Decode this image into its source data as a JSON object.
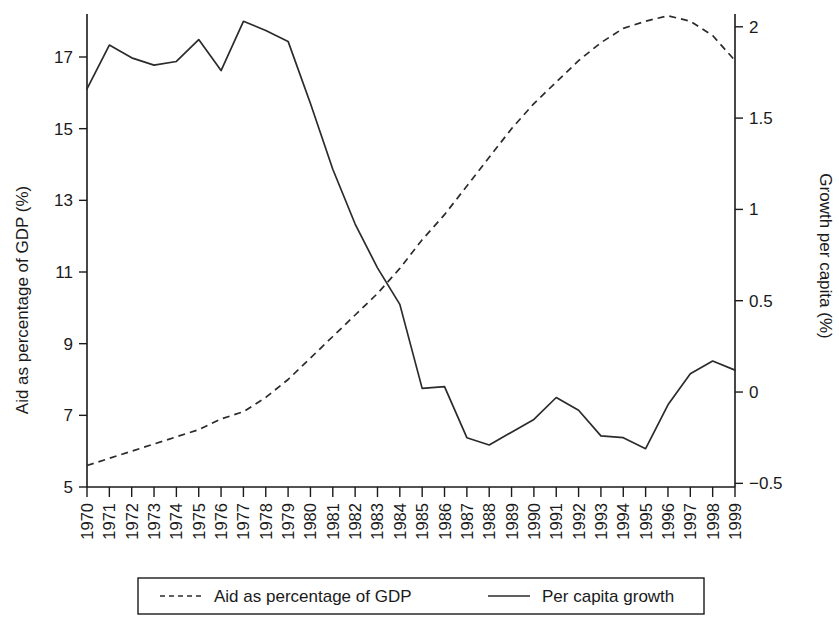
{
  "chart_data": {
    "type": "line",
    "title": "",
    "xlabel": "",
    "x": [
      1970,
      1971,
      1972,
      1973,
      1974,
      1975,
      1976,
      1977,
      1978,
      1979,
      1980,
      1981,
      1982,
      1983,
      1984,
      1985,
      1986,
      1987,
      1988,
      1989,
      1990,
      1991,
      1992,
      1993,
      1994,
      1995,
      1996,
      1997,
      1998,
      1999
    ],
    "xtick_labels": [
      "1970",
      "1971",
      "1972",
      "1973",
      "1974",
      "1975",
      "1976",
      "1977",
      "1978",
      "1979",
      "1980",
      "1981",
      "1982",
      "1983",
      "1984",
      "1985",
      "1986",
      "1987",
      "1988",
      "1989",
      "1990",
      "1991",
      "1992",
      "1993",
      "1994",
      "1995",
      "1996",
      "1997",
      "1998",
      "1999"
    ],
    "left_axis": {
      "label": "Aid as percentage of GDP (%)",
      "ticks": [
        5,
        7,
        9,
        11,
        13,
        15,
        17
      ],
      "tick_labels": [
        "5",
        "7",
        "9",
        "11",
        "13",
        "15",
        "17"
      ],
      "ylim": [
        5,
        18.2
      ]
    },
    "right_axis": {
      "label": "Growth per capita (%)",
      "ticks": [
        -0.5,
        0,
        0.5,
        1,
        1.5,
        2
      ],
      "tick_labels": [
        "-0.5",
        "0",
        "0.5",
        "1",
        "1.5",
        "2"
      ],
      "ylim": [
        -0.52,
        2.07
      ]
    },
    "grid": false,
    "legend_position": "bottom",
    "series": [
      {
        "name": "Aid as percentage of GDP",
        "style": "dashed",
        "axis": "left",
        "color": "#2b2b2b",
        "values": [
          5.6,
          5.8,
          6.0,
          6.2,
          6.4,
          6.6,
          6.9,
          7.1,
          7.5,
          8.0,
          8.6,
          9.2,
          9.8,
          10.4,
          11.1,
          11.9,
          12.6,
          13.4,
          14.2,
          15.0,
          15.7,
          16.3,
          16.9,
          17.4,
          17.8,
          18.0,
          18.15,
          18.0,
          17.6,
          16.9
        ]
      },
      {
        "name": "Per capita growth",
        "style": "solid",
        "axis": "right",
        "color": "#2b2b2b",
        "values": [
          1.66,
          1.9,
          1.83,
          1.79,
          1.81,
          1.93,
          1.76,
          2.03,
          1.98,
          1.92,
          1.58,
          1.22,
          0.92,
          0.68,
          0.48,
          0.02,
          0.03,
          -0.25,
          -0.29,
          -0.22,
          -0.15,
          -0.03,
          -0.1,
          -0.24,
          -0.25,
          -0.31,
          -0.07,
          0.1,
          0.17,
          0.12
        ]
      }
    ],
    "legend": [
      {
        "label": "Aid as percentage of GDP",
        "style": "dashed"
      },
      {
        "label": "Per capita growth",
        "style": "solid"
      }
    ]
  }
}
